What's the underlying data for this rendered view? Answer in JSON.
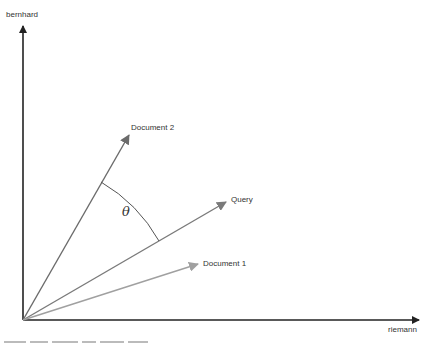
{
  "diagram": {
    "type": "vector-space-model",
    "axes": {
      "y_label": "bernhard",
      "x_label": "riemann"
    },
    "vectors": [
      {
        "name": "Document 2",
        "color": "#6b6b6b"
      },
      {
        "name": "Query",
        "color": "#7a7a7a"
      },
      {
        "name": "Document 1",
        "color": "#9e9e9e"
      }
    ],
    "angle_label": "θ",
    "axis_color": "#333333",
    "caption": "(caption clipped at image bottom, illegible)"
  }
}
